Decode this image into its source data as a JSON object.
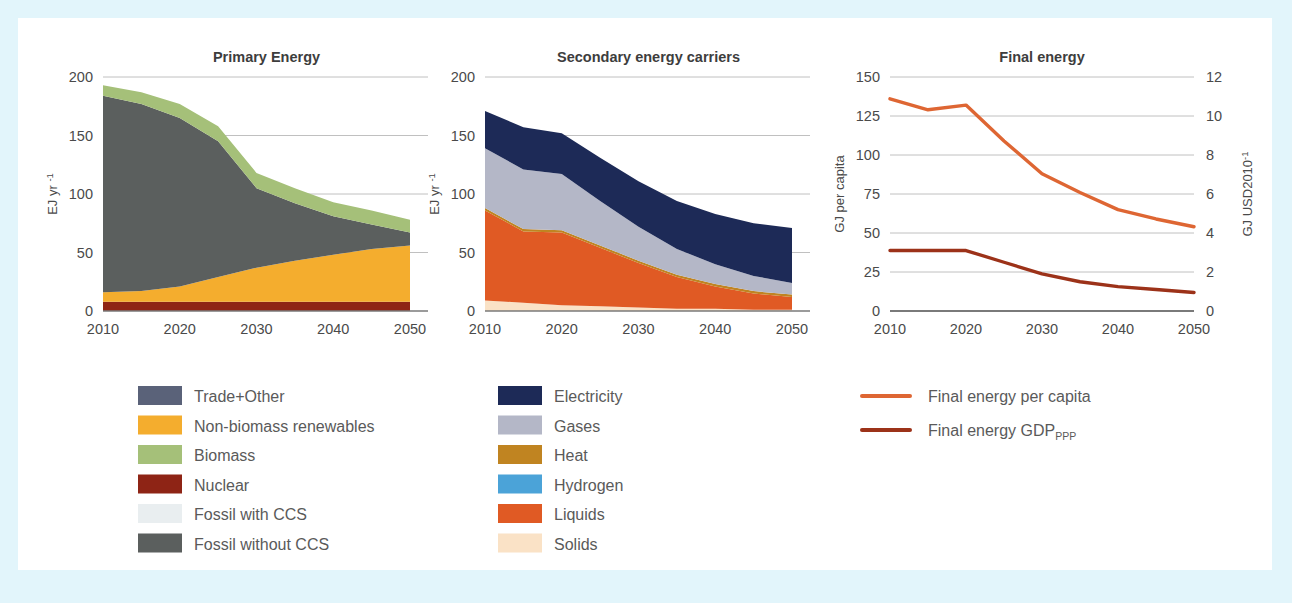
{
  "figure": {
    "background": "#e2f5fb",
    "panel_background": "#ffffff",
    "axis_text_color": "#4a4a4a",
    "gridline_color": "#b9b9b9",
    "zero_line_color": "#7a7a7a"
  },
  "chart_data": [
    {
      "id": "primary-energy",
      "type": "area",
      "title": "Primary Energy",
      "xlabel": "",
      "ylabel": "EJ yr",
      "ylabel_sup": "-1",
      "x": [
        2010,
        2015,
        2020,
        2025,
        2030,
        2035,
        2040,
        2045,
        2050
      ],
      "xticks": [
        2010,
        2020,
        2030,
        2040,
        2050
      ],
      "yticks": [
        0,
        50,
        100,
        150,
        200
      ],
      "ylim": [
        0,
        200
      ],
      "gridlines": true,
      "stack_order_bottom_to_top": [
        "Nuclear",
        "Non-biomass renewables",
        "Fossil without CCS",
        "Fossil with CCS",
        "Biomass",
        "Trade+Other"
      ],
      "series": [
        {
          "name": "Nuclear",
          "color": "#8e2415",
          "values": [
            8,
            8,
            8,
            8,
            8,
            8,
            8,
            8,
            8
          ]
        },
        {
          "name": "Non-biomass renewables",
          "color": "#f4ad2e",
          "values": [
            8,
            9,
            13,
            21,
            29,
            35,
            40,
            45,
            48
          ]
        },
        {
          "name": "Fossil without CCS",
          "color": "#5b5f5e",
          "values": [
            168,
            160,
            144,
            116,
            68,
            49,
            33,
            21,
            11
          ]
        },
        {
          "name": "Fossil with CCS",
          "color": "#e9eef0",
          "values": [
            0,
            0,
            0,
            0,
            0,
            0,
            0,
            0,
            0
          ]
        },
        {
          "name": "Biomass",
          "color": "#a5c079",
          "values": [
            9,
            10,
            12,
            13,
            13,
            13,
            12,
            12,
            11
          ]
        },
        {
          "name": "Trade+Other",
          "color": "#5a6279",
          "values": [
            0,
            0,
            0,
            0,
            0,
            0,
            0,
            0,
            0
          ]
        }
      ],
      "totals": [
        193,
        187,
        177,
        158,
        118,
        105,
        93,
        86,
        78
      ]
    },
    {
      "id": "secondary-energy-carriers",
      "type": "area",
      "title": "Secondary energy carriers",
      "xlabel": "",
      "ylabel": "EJ yr",
      "ylabel_sup": "-1",
      "x": [
        2010,
        2015,
        2020,
        2025,
        2030,
        2035,
        2040,
        2045,
        2050
      ],
      "xticks": [
        2010,
        2020,
        2030,
        2040,
        2050
      ],
      "yticks": [
        0,
        50,
        100,
        150,
        200
      ],
      "ylim": [
        0,
        200
      ],
      "gridlines": true,
      "stack_order_bottom_to_top": [
        "Solids",
        "Liquids",
        "Hydrogen",
        "Heat",
        "Gases",
        "Electricity"
      ],
      "series": [
        {
          "name": "Solids",
          "color": "#fae2c6",
          "values": [
            9,
            7,
            5,
            4,
            3,
            2,
            2,
            1,
            1
          ]
        },
        {
          "name": "Liquids",
          "color": "#e05a24",
          "values": [
            77,
            61,
            62,
            50,
            38,
            27,
            19,
            14,
            11
          ]
        },
        {
          "name": "Hydrogen",
          "color": "#4ba3d8",
          "values": [
            0,
            0,
            0,
            0,
            0,
            0,
            0,
            0,
            0
          ]
        },
        {
          "name": "Heat",
          "color": "#c08421",
          "values": [
            2,
            2,
            2,
            2,
            2,
            2,
            2,
            2,
            2
          ]
        },
        {
          "name": "Gases",
          "color": "#b4b7c7",
          "values": [
            51,
            51,
            48,
            38,
            29,
            22,
            17,
            13,
            10
          ]
        },
        {
          "name": "Electricity",
          "color": "#1d2a57",
          "values": [
            32,
            36,
            35,
            37,
            39,
            41,
            43,
            45,
            47
          ]
        }
      ],
      "totals": [
        171,
        157,
        152,
        131,
        111,
        94,
        83,
        75,
        71
      ]
    },
    {
      "id": "final-energy",
      "type": "line",
      "title": "Final energy",
      "xlabel": "",
      "ylabel_left": "GJ per capita",
      "ylabel_right": "GJ USD2010",
      "ylabel_right_sup": "-1",
      "x": [
        2010,
        2015,
        2020,
        2025,
        2030,
        2035,
        2040,
        2045,
        2050
      ],
      "xticks": [
        2010,
        2020,
        2030,
        2040,
        2050
      ],
      "yticks_left": [
        0,
        25,
        50,
        75,
        100,
        125,
        150
      ],
      "yticks_right": [
        0,
        2,
        4,
        6,
        8,
        10,
        12
      ],
      "ylim_left": [
        0,
        150
      ],
      "ylim_right": [
        0,
        12
      ],
      "gridlines": true,
      "series": [
        {
          "name": "Final energy per capita",
          "axis": "left",
          "color": "#de6633",
          "values": [
            136,
            129,
            132,
            109,
            88,
            76,
            65,
            59,
            54
          ]
        },
        {
          "name": "Final energy GDP_PPP",
          "axis": "right",
          "color": "#9c3219",
          "values": [
            3.1,
            3.1,
            3.1,
            2.5,
            1.9,
            1.5,
            1.25,
            1.1,
            0.95
          ]
        }
      ]
    }
  ],
  "legends": [
    {
      "id": "primary-energy-legend",
      "items": [
        {
          "label": "Trade+Other",
          "color": "#5a6279"
        },
        {
          "label": "Non-biomass renewables",
          "color": "#f4ad2e"
        },
        {
          "label": "Biomass",
          "color": "#a5c079"
        },
        {
          "label": "Nuclear",
          "color": "#8e2415"
        },
        {
          "label": "Fossil with CCS",
          "color": "#e9eef0"
        },
        {
          "label": "Fossil without CCS",
          "color": "#5b5f5e"
        }
      ]
    },
    {
      "id": "secondary-energy-legend",
      "items": [
        {
          "label": "Electricity",
          "color": "#1d2a57"
        },
        {
          "label": "Gases",
          "color": "#b4b7c7"
        },
        {
          "label": "Heat",
          "color": "#c08421"
        },
        {
          "label": "Hydrogen",
          "color": "#4ba3d8"
        },
        {
          "label": "Liquids",
          "color": "#e05a24"
        },
        {
          "label": "Solids",
          "color": "#fae2c6"
        }
      ]
    },
    {
      "id": "final-energy-legend",
      "items": [
        {
          "label": "Final energy per capita",
          "sub": "",
          "color": "#de6633"
        },
        {
          "label": "Final energy GDP",
          "sub": "PPP",
          "color": "#9c3219"
        }
      ]
    }
  ]
}
